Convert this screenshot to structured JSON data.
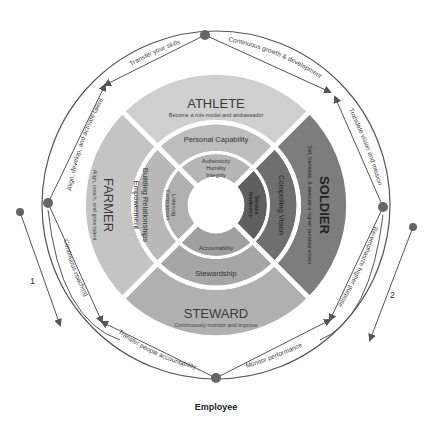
{
  "diagram": {
    "bottom_label": "Employee",
    "side_numbers": [
      "1",
      "2"
    ],
    "quadrants": {
      "top": {
        "title": "ATHLETE",
        "subtitle": "Become a role model and ambassador",
        "color": "#cfcfcf"
      },
      "right": {
        "title": "SOLDIER",
        "subtitle": "Set, translate, & execute a higher purpose vision",
        "color": "#7d7d7d"
      },
      "bottom": {
        "title": "STEWARD",
        "subtitle": "Continuously monitor and improve",
        "color": "#b0b0b0"
      },
      "left": {
        "title": "FARMER",
        "subtitle": "Align, coach, and grow talent",
        "color": "#c4c4c4"
      }
    },
    "middle_ring": {
      "top": "Personal Capability",
      "right": "Compelling Vision",
      "bottom": "Stewardship",
      "left_line1": "Building Relationships",
      "left_line2": "Empowerment"
    },
    "inner_ring": {
      "top_line1": "Authenticity",
      "top_line2": "Humility",
      "top_line3": "Integrity",
      "right_line1": "Servant",
      "right_line2": "leadership",
      "bottom": "Accountability",
      "left_line1": "Listening",
      "left_line2": "Compassion"
    },
    "outer_arrows": {
      "top_left": "Transfer your skills",
      "top_right": "Continuous growth & development",
      "right_top": "Translate vision and mission",
      "right_bottom": "Re-emphasize higher purpose",
      "bottom_right": "Monitor performance",
      "bottom_left": "Transfer people accountability",
      "left_bottom": "Continuous coaching",
      "left_top": "Align, develop, and activate talent"
    }
  }
}
